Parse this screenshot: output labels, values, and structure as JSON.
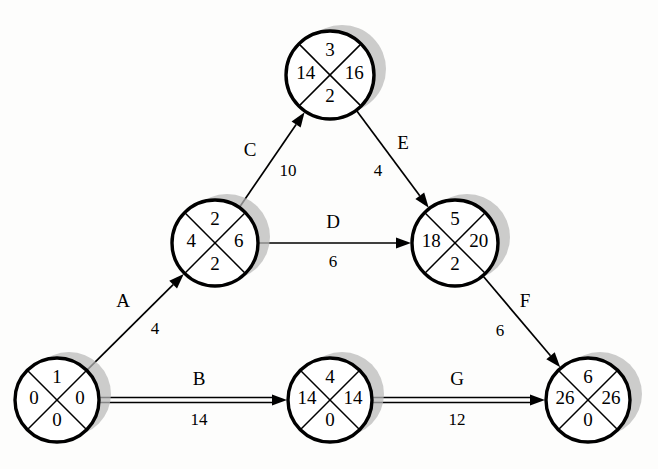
{
  "diagram": {
    "type": "activity-on-arrow-network",
    "canvas": {
      "width": 658,
      "height": 469,
      "background": "#fdfdfc"
    },
    "colors": {
      "node_fill": "#ffffff",
      "node_stroke": "#000000",
      "shadow": "#b9b9b9",
      "text": "#000000"
    },
    "node_legend": {
      "top": "event number",
      "left": "earliest event time",
      "right": "latest event time",
      "bottom": "slack"
    },
    "nodes": [
      {
        "id": "node-1",
        "cx": 57,
        "cy": 400,
        "r": 42,
        "top": "1",
        "left": "0",
        "right": "0",
        "bottom": "0"
      },
      {
        "id": "node-2",
        "cx": 215,
        "cy": 243,
        "r": 43,
        "top": "2",
        "left": "4",
        "right": "6",
        "bottom": "2"
      },
      {
        "id": "node-3",
        "cx": 330,
        "cy": 75,
        "r": 44,
        "top": "3",
        "left": "14",
        "right": "16",
        "bottom": "2"
      },
      {
        "id": "node-4",
        "cx": 330,
        "cy": 400,
        "r": 42,
        "top": "4",
        "left": "14",
        "right": "14",
        "bottom": "0"
      },
      {
        "id": "node-5",
        "cx": 455,
        "cy": 243,
        "r": 43,
        "top": "5",
        "left": "18",
        "right": "20",
        "bottom": "2"
      },
      {
        "id": "node-6",
        "cx": 588,
        "cy": 400,
        "r": 42,
        "top": "6",
        "left": "26",
        "right": "26",
        "bottom": "0"
      }
    ],
    "edges": [
      {
        "id": "edge-a",
        "label": "A",
        "duration": "4",
        "from": "node-1",
        "to": "node-2",
        "double": false,
        "label_x": 123,
        "label_y": 303,
        "duration_x": 155,
        "duration_y": 330
      },
      {
        "id": "edge-b",
        "label": "B",
        "duration": "14",
        "from": "node-1",
        "to": "node-4",
        "double": true,
        "label_x": 199,
        "label_y": 381,
        "duration_x": 199,
        "duration_y": 421
      },
      {
        "id": "edge-c",
        "label": "C",
        "duration": "10",
        "from": "node-2",
        "to": "node-3",
        "double": false,
        "label_x": 250,
        "label_y": 152,
        "duration_x": 288,
        "duration_y": 172
      },
      {
        "id": "edge-d",
        "label": "D",
        "duration": "6",
        "from": "node-2",
        "to": "node-5",
        "double": false,
        "label_x": 333,
        "label_y": 224,
        "duration_x": 333,
        "duration_y": 263
      },
      {
        "id": "edge-e",
        "label": "E",
        "duration": "4",
        "from": "node-3",
        "to": "node-5",
        "double": false,
        "label_x": 403,
        "label_y": 145,
        "duration_x": 378,
        "duration_y": 172
      },
      {
        "id": "edge-f",
        "label": "F",
        "duration": "6",
        "from": "node-5",
        "to": "node-6",
        "double": false,
        "label_x": 525,
        "label_y": 303,
        "duration_x": 500,
        "duration_y": 332
      },
      {
        "id": "edge-g",
        "label": "G",
        "duration": "12",
        "from": "node-4",
        "to": "node-6",
        "double": true,
        "label_x": 457,
        "label_y": 381,
        "duration_x": 457,
        "duration_y": 421
      }
    ]
  }
}
